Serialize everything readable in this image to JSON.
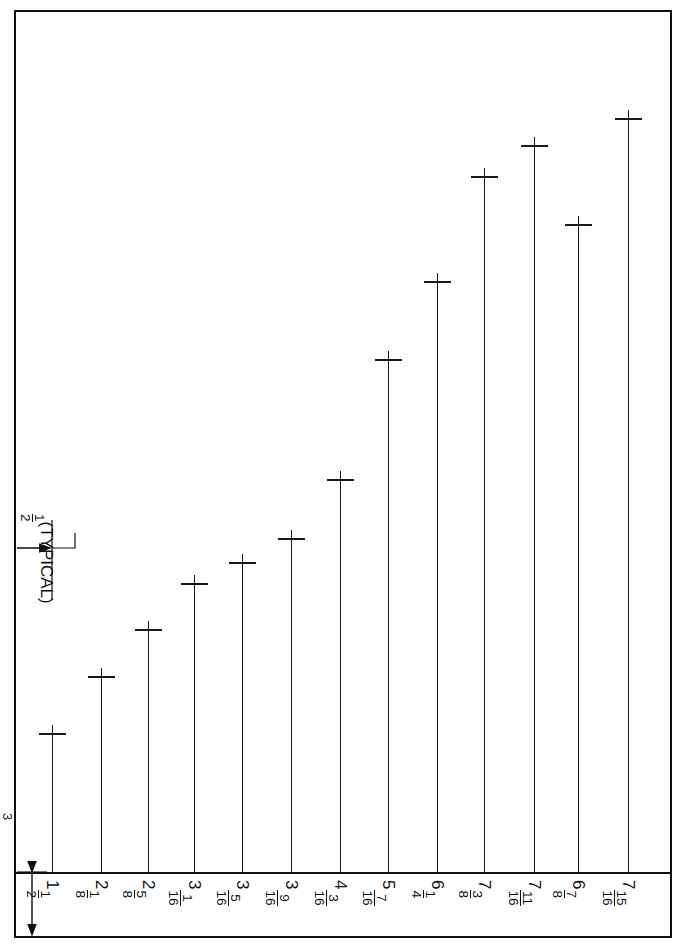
{
  "document": {
    "type": "engineering-bar-dimension-drawing",
    "orientation": "labels-rotated-90deg",
    "background_color": "#ffffff",
    "line_color": "#111111",
    "border_color": "#111111"
  },
  "annotations": {
    "typical": {
      "whole": "",
      "numerator": "1",
      "denominator": "2",
      "suffix": "(TYPICAL)"
    },
    "baseline_offset": {
      "whole": "",
      "numerator": "3",
      "denominator": "4",
      "suffix": ""
    }
  },
  "chart_data": {
    "type": "bar",
    "title": "",
    "xlabel": "",
    "ylabel": "",
    "grid": false,
    "legend": null,
    "units": "inches",
    "categories": [
      "1 1/2",
      "2 1/8",
      "2 5/8",
      "3 1/16",
      "3 5/16",
      "3 9/16",
      "4 3/16",
      "5 7/16",
      "6 1/4",
      "7 3/8",
      "7 11/16",
      "6 7/8",
      "7 15/16"
    ],
    "values": [
      1.5,
      2.125,
      2.625,
      3.0625,
      3.3125,
      3.5625,
      4.1875,
      5.4375,
      6.25,
      7.375,
      7.6875,
      6.875,
      7.9375
    ],
    "ylim": [
      0,
      8.2
    ],
    "bars": [
      {
        "label_whole": "1",
        "label_num": "1",
        "label_den": "2",
        "value": 1.5,
        "x": 52,
        "top": 733
      },
      {
        "label_whole": "2",
        "label_num": "1",
        "label_den": "8",
        "value": 2.125,
        "x": 101,
        "top": 676
      },
      {
        "label_whole": "2",
        "label_num": "5",
        "label_den": "8",
        "value": 2.625,
        "x": 148,
        "top": 629
      },
      {
        "label_whole": "3",
        "label_num": "1",
        "label_den": "16",
        "value": 3.0625,
        "x": 194,
        "top": 583
      },
      {
        "label_whole": "3",
        "label_num": "5",
        "label_den": "16",
        "value": 3.3125,
        "x": 242,
        "top": 562
      },
      {
        "label_whole": "3",
        "label_num": "9",
        "label_den": "16",
        "value": 3.5625,
        "x": 291,
        "top": 538
      },
      {
        "label_whole": "4",
        "label_num": "3",
        "label_den": "16",
        "value": 4.1875,
        "x": 340,
        "top": 479
      },
      {
        "label_whole": "5",
        "label_num": "7",
        "label_den": "16",
        "value": 5.4375,
        "x": 388,
        "top": 359
      },
      {
        "label_whole": "6",
        "label_num": "1",
        "label_den": "4",
        "value": 6.25,
        "x": 437,
        "top": 281
      },
      {
        "label_whole": "7",
        "label_num": "3",
        "label_den": "8",
        "value": 7.375,
        "x": 484,
        "top": 176
      },
      {
        "label_whole": "7",
        "label_num": "11",
        "label_den": "16",
        "value": 7.6875,
        "x": 534,
        "top": 145
      },
      {
        "label_whole": "6",
        "label_num": "7",
        "label_den": "8",
        "value": 6.875,
        "x": 578,
        "top": 224
      },
      {
        "label_whole": "7",
        "label_num": "15",
        "label_den": "16",
        "value": 7.9375,
        "x": 628,
        "top": 118
      }
    ]
  }
}
